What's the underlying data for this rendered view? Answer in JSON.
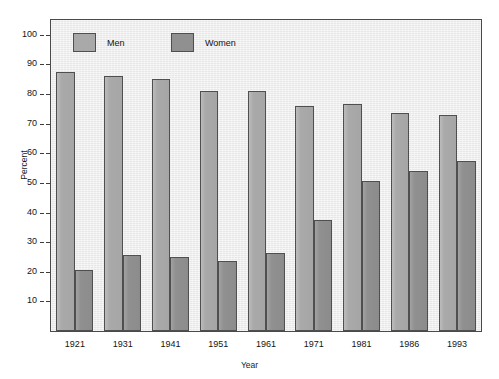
{
  "chart_data": {
    "type": "bar",
    "title": "",
    "xlabel": "Year",
    "ylabel": "Percent",
    "categories": [
      "1921",
      "1931",
      "1941",
      "1951",
      "1961",
      "1971",
      "1981",
      "1986",
      "1993"
    ],
    "series": [
      {
        "name": "Men",
        "color": "#a9a9a9",
        "values": [
          87.5,
          86.0,
          85.0,
          81.0,
          81.0,
          76.0,
          76.5,
          73.5,
          73.0
        ]
      },
      {
        "name": "Women",
        "color": "#909090",
        "values": [
          20.5,
          25.5,
          25.0,
          23.5,
          26.5,
          37.5,
          50.5,
          54.0,
          57.5
        ]
      }
    ],
    "ylim": [
      0,
      105
    ],
    "yticks": [
      10,
      20,
      30,
      40,
      50,
      60,
      70,
      80,
      90,
      100
    ],
    "ytick_labels": [
      "10",
      "20",
      "30",
      "40",
      "50",
      "60",
      "70",
      "80",
      "90",
      "100"
    ],
    "grid": false,
    "legend_position": "top-left-inside",
    "plot_background": "#ededed",
    "frame_color": "#4a4a4a"
  },
  "legend": {
    "entries": [
      {
        "label": "Men"
      },
      {
        "label": "Women"
      }
    ]
  },
  "axes": {
    "y_title": "Percent",
    "x_title": "Year"
  },
  "artifacts": {
    "top_cropped_text": "."
  }
}
